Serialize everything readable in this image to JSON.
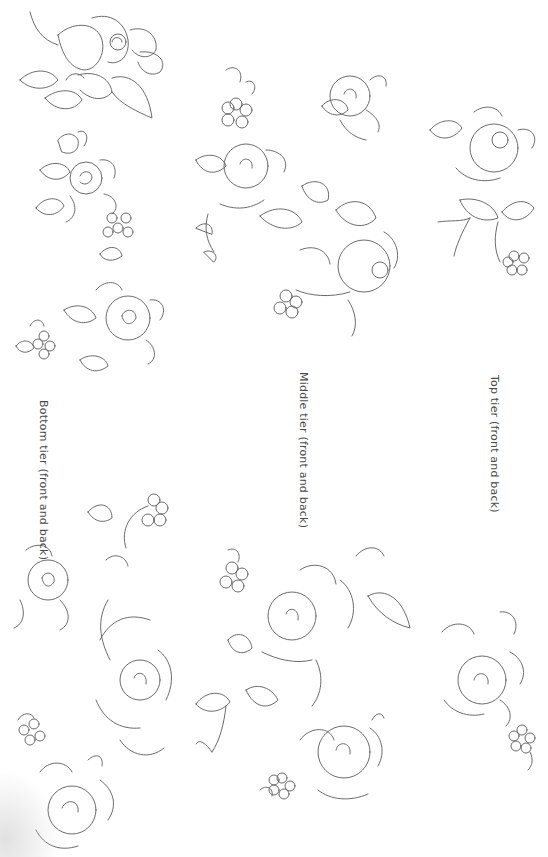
{
  "sheet": {
    "type": "embroidery-pattern-sheet",
    "orientation": "rotated-90-clockwise"
  },
  "labels": {
    "top": "Top tier (front and back)",
    "middle": "Middle tier (front and back)",
    "bottom": "Bottom tier (front and back)"
  },
  "motifs": [
    {
      "tier": "bottom",
      "kind": "rose-with-stem",
      "region": "top-left"
    },
    {
      "tier": "bottom",
      "kind": "rose-small",
      "region": "left-upper"
    },
    {
      "tier": "bottom",
      "kind": "five-petal-blossom",
      "region": "left-upper"
    },
    {
      "tier": "bottom",
      "kind": "rose-with-blossom",
      "region": "left-middle"
    },
    {
      "tier": "bottom",
      "kind": "rose-spray",
      "region": "left-lower"
    },
    {
      "tier": "bottom",
      "kind": "rose-with-blossom",
      "region": "bottom-left"
    },
    {
      "tier": "middle",
      "kind": "rose-spray",
      "region": "center-upper"
    },
    {
      "tier": "middle",
      "kind": "rose-small",
      "region": "center-top"
    },
    {
      "tier": "middle",
      "kind": "large-rose-spray",
      "region": "center"
    },
    {
      "tier": "middle",
      "kind": "large-rose-spray",
      "region": "center-lower"
    },
    {
      "tier": "middle",
      "kind": "rose-with-blossom",
      "region": "center-bottom"
    },
    {
      "tier": "top",
      "kind": "rose-with-leaves",
      "region": "right-upper"
    },
    {
      "tier": "top",
      "kind": "rose-with-blossom",
      "region": "right-lower"
    }
  ],
  "colors": {
    "background": "#ffffff",
    "line": "#5a5a5a",
    "text": "#4a4a4a"
  }
}
